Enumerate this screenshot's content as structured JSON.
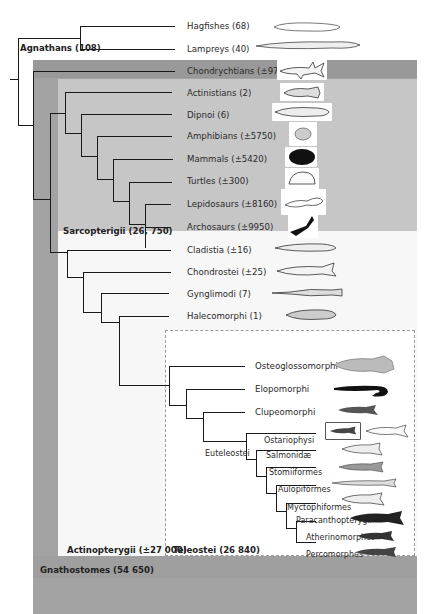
{
  "figure": {
    "type": "phylogenetic-tree"
  },
  "groups": {
    "agnathans": "Agnathans (108)",
    "sarcopterigii": "Sarcopterigii (26, 750)",
    "actinopterygii": "Actinopterygii (±27 000)",
    "teleostei": "Teleostei (26 840)",
    "gnathostomes": "Gnathostomes (54 650)",
    "euteleostei": "Euteleostei"
  },
  "taxa": [
    {
      "id": "hagfishes",
      "label": "Hagfishes (68)"
    },
    {
      "id": "lampreys",
      "label": "Lampreys (40)"
    },
    {
      "id": "chondrychtians",
      "label": "Chondrychtians (±970)"
    },
    {
      "id": "actinistians",
      "label": "Actinistians (2)"
    },
    {
      "id": "dipnoi",
      "label": "Dipnoi (6)"
    },
    {
      "id": "amphibians",
      "label": "Amphibians (±5750)"
    },
    {
      "id": "mammals",
      "label": "Mammals (±5420)"
    },
    {
      "id": "turtles",
      "label": "Turtles (±300)"
    },
    {
      "id": "lepidosaurs",
      "label": "Lepidosaurs (±8160)"
    },
    {
      "id": "archosaurs",
      "label": "Archosaurs (±9950)"
    },
    {
      "id": "cladistia",
      "label": "Cladistia (±16)"
    },
    {
      "id": "chondrostei",
      "label": "Chondrostei (±25)"
    },
    {
      "id": "gynglimodi",
      "label": "Gynglimodi (7)"
    },
    {
      "id": "halecomorphi",
      "label": "Halecomorphi (1)"
    },
    {
      "id": "osteoglossomorphi",
      "label": "Osteoglossomorphi"
    },
    {
      "id": "elopomorphi",
      "label": "Elopomorphi"
    },
    {
      "id": "clupeomorphi",
      "label": "Clupeomorphi"
    },
    {
      "id": "ostariophysi",
      "label": "Ostariophysi"
    },
    {
      "id": "salmonidae",
      "label": "Salmonidæ"
    },
    {
      "id": "stomiiformes",
      "label": "Stomiiformes"
    },
    {
      "id": "aulopiformes",
      "label": "Aulopiformes"
    },
    {
      "id": "myctophiformes",
      "label": "Myctophiformes"
    },
    {
      "id": "paracanthopterygii",
      "label": "Paracanthopterygii"
    },
    {
      "id": "atherinomorphes",
      "label": "Atherinomorphes"
    },
    {
      "id": "percomorphes",
      "label": "Percomorphes"
    }
  ],
  "colors": {
    "gnathostomes_panel": "#a3a3a3",
    "chondrichthyes_band": "#999999",
    "sarcopterigii_panel": "#c6c6c6",
    "actinopterygii_panel": "#f7f7f7",
    "teleostei_panel": "#ffffff",
    "branch": "#1a1a1a"
  }
}
